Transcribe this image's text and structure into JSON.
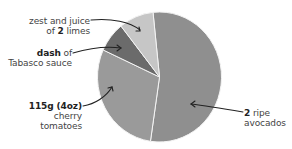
{
  "chart_data": {
    "type": "pie",
    "title": "",
    "start_angle_deg": 354,
    "direction": "clockwise",
    "slices": [
      {
        "id": "avocados",
        "label_bold": "2",
        "label_rest": " ripe",
        "label_line2": "avocados",
        "value": 54,
        "color": "#8f8f8f"
      },
      {
        "id": "tomatoes",
        "label_bold": "115g (4oz)",
        "label_rest": "",
        "label_line2": "cherry",
        "label_line3": "tomatoes",
        "value": 29.5,
        "color": "#9a9a9a"
      },
      {
        "id": "tabasco",
        "label_bold": "dash",
        "label_rest": " of",
        "label_line2": "Tabasco sauce",
        "value": 7.5,
        "color": "#6b6b6b"
      },
      {
        "id": "limes",
        "label_pre": "zest and juice",
        "label_line2_pre": "of ",
        "label_bold": "2",
        "label_rest": " limes",
        "value": 9,
        "color": "#c6c6c6"
      }
    ],
    "separator_color": "#f4f4f4",
    "legend": "none (callout labels with arrows)"
  },
  "labels": {
    "limes": {
      "line1": "zest and juice",
      "line2_pre": "of ",
      "line2_bold": "2",
      "line2_post": " limes"
    },
    "tabasco": {
      "bold": "dash",
      "post": " of",
      "line2": "Tabasco sauce"
    },
    "tomatoes": {
      "bold": "115g (4oz)",
      "line2": "cherry",
      "line3": "tomatoes"
    },
    "avocados": {
      "bold": "2",
      "post": " ripe",
      "line2": "avocados"
    }
  }
}
